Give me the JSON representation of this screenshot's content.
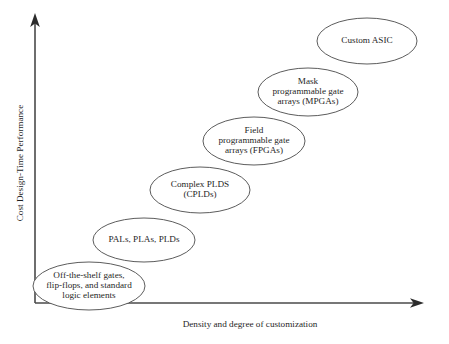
{
  "figure": {
    "type": "conceptual-progression-diagram",
    "background_color": "#ffffff",
    "line_color": "#4a4a4a",
    "text_color": "#1f1f1f"
  },
  "axes": {
    "y_label": "Cost Design-Time Performance",
    "x_label": "Density and degree of customization",
    "y_axis_name": "vertical-axis",
    "x_axis_name": "horizontal-axis"
  },
  "chart_data": {
    "type": "scatter",
    "title": "",
    "xlabel": "Density and degree of customization",
    "ylabel": "Cost Design-Time Performance",
    "grid": false,
    "legend": "none",
    "note": "Six overlapping ellipses arranged along an increasing diagonal, representing technology options ordered by density/customization versus cost, design time and performance.",
    "categories": [
      "Off-the-shelf gates, flip-flops, and standard logic elements",
      "PALs, PLAs, PLDs",
      "Complex PLDS (CPLDs)",
      "Field programmable gate arrays (FPGAs)",
      "Mask programmable gate arrays (MPGAs)",
      "Custom ASIC"
    ],
    "x": [
      89,
      144,
      200,
      254,
      308,
      367
    ],
    "y": [
      286,
      240,
      190,
      141,
      92,
      41
    ],
    "xlim": [
      35,
      424
    ],
    "ylim": [
      303,
      14
    ]
  },
  "nodes": [
    {
      "name": "ellipse-off-the-shelf",
      "lines": [
        "Off-the-shelf gates,",
        "flip-flops, and standard",
        "logic elements"
      ],
      "cx": 89,
      "cy": 286,
      "rx": 56,
      "ry": 24,
      "line_gap": 10.4
    },
    {
      "name": "ellipse-pals-plas-plds",
      "lines": [
        "PALs, PLAs, PLDs"
      ],
      "cx": 144,
      "cy": 240,
      "rx": 51,
      "ry": 22,
      "line_gap": 10.4
    },
    {
      "name": "ellipse-complex-plds",
      "lines": [
        "Complex PLDS",
        "(CPLDs)"
      ],
      "cx": 200,
      "cy": 190,
      "rx": 50,
      "ry": 23,
      "line_gap": 10.4
    },
    {
      "name": "ellipse-fpga",
      "lines": [
        "Field",
        "programmable gate",
        "arrays (FPGAs)"
      ],
      "cx": 254,
      "cy": 141,
      "rx": 51,
      "ry": 24,
      "line_gap": 10.4
    },
    {
      "name": "ellipse-mpga",
      "lines": [
        "Mask",
        "programmable gate",
        "arrays (MPGAs)"
      ],
      "cx": 308,
      "cy": 92,
      "rx": 50,
      "ry": 24,
      "line_gap": 10.4
    },
    {
      "name": "ellipse-custom-asic",
      "lines": [
        "Custom ASIC"
      ],
      "cx": 367,
      "cy": 41,
      "rx": 50,
      "ry": 23,
      "line_gap": 10.4
    }
  ]
}
